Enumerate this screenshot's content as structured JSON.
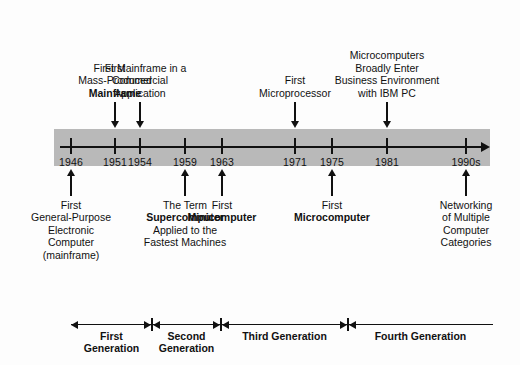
{
  "diagram": {
    "band_color": "#b9b9b9",
    "ink_color": "#111111"
  },
  "axis": {
    "start_year_label": "1946",
    "end_year_label": "1990s",
    "ticks": [
      {
        "label": "1946",
        "x": 71
      },
      {
        "label": "1951",
        "x": 115
      },
      {
        "label": "1954",
        "x": 140
      },
      {
        "label": "1959",
        "x": 185
      },
      {
        "label": "1963",
        "x": 222
      },
      {
        "label": "1971",
        "x": 295
      },
      {
        "label": "1975",
        "x": 332
      },
      {
        "label": "1981",
        "x": 387
      },
      {
        "label": "1990s",
        "x": 466
      }
    ]
  },
  "callouts_above": [
    {
      "id": "first-mass-produced-mainframe",
      "year": "1951",
      "x": 115,
      "lines": [
        {
          "text": "First",
          "bold": false
        },
        {
          "text": "Mass-Produced",
          "bold": false
        },
        {
          "text": "Mainframe",
          "bold": true
        }
      ]
    },
    {
      "id": "first-mainframe-commercial",
      "year": "1954",
      "x": 140,
      "lines": [
        {
          "text": "First Mainframe in a",
          "bold": false
        },
        {
          "text": "Commercial",
          "bold": false
        },
        {
          "text": "Application",
          "bold": false
        }
      ]
    },
    {
      "id": "first-microprocessor",
      "year": "1971",
      "x": 295,
      "lines": [
        {
          "text": "First",
          "bold": false
        },
        {
          "text": "Microprocessor",
          "bold": false
        }
      ]
    },
    {
      "id": "microcomputers-business",
      "year": "1981",
      "x": 387,
      "lines": [
        {
          "text": "Microcomputers",
          "bold": false
        },
        {
          "text": "Broadly Enter",
          "bold": false
        },
        {
          "text": "Business Environment",
          "bold": false
        },
        {
          "text": "with IBM PC",
          "bold": false
        }
      ]
    }
  ],
  "callouts_below": [
    {
      "id": "first-general-purpose-computer",
      "year": "1946",
      "x": 71,
      "lines": [
        {
          "text": "First",
          "bold": false
        },
        {
          "text": "General-Purpose",
          "bold": false
        },
        {
          "text": "Electronic",
          "bold": false
        },
        {
          "text": "Computer",
          "bold": false
        },
        {
          "text": "(mainframe)",
          "bold": false
        }
      ]
    },
    {
      "id": "term-supercomputer",
      "year": "1959",
      "x": 185,
      "lines": [
        {
          "text": "The Term",
          "bold": false
        },
        {
          "text": "Supercomputer",
          "bold": true
        },
        {
          "text": "Applied to the",
          "bold": false
        },
        {
          "text": "Fastest Machines",
          "bold": false
        }
      ]
    },
    {
      "id": "first-minicomputer",
      "year": "1963",
      "x": 222,
      "lines": [
        {
          "text": "First",
          "bold": false
        },
        {
          "text": "Minicomputer",
          "bold": true
        }
      ]
    },
    {
      "id": "first-microcomputer",
      "year": "1975",
      "x": 332,
      "lines": [
        {
          "text": "First",
          "bold": false
        },
        {
          "text": "Microcomputer",
          "bold": true
        }
      ]
    },
    {
      "id": "networking-multiple-categories",
      "year": "1990s",
      "x": 466,
      "lines": [
        {
          "text": "Networking",
          "bold": false
        },
        {
          "text": "of Multiple",
          "bold": false
        },
        {
          "text": "Computer",
          "bold": false
        },
        {
          "text": "Categories",
          "bold": false
        }
      ]
    }
  ],
  "generations": [
    {
      "id": "first-generation",
      "lines": [
        "First",
        "Generation"
      ],
      "start": 71,
      "end": 152
    },
    {
      "id": "second-generation",
      "lines": [
        "Second",
        "Generation"
      ],
      "start": 152,
      "end": 221
    },
    {
      "id": "third-generation",
      "lines": [
        "Third Generation"
      ],
      "start": 221,
      "end": 348
    },
    {
      "id": "fourth-generation",
      "lines": [
        "Fourth Generation"
      ],
      "start": 348,
      "end": 493
    }
  ],
  "chart_data": {
    "type": "timeline",
    "xlabel": "Year",
    "axis_range": [
      "1946",
      "1990s"
    ],
    "tick_labels": [
      "1946",
      "1951",
      "1954",
      "1959",
      "1963",
      "1971",
      "1975",
      "1981",
      "1990s"
    ],
    "events": [
      {
        "year": "1946",
        "label": "First General-Purpose Electronic Computer (mainframe)",
        "side": "below"
      },
      {
        "year": "1951",
        "label": "First Mass-Produced Mainframe",
        "side": "above"
      },
      {
        "year": "1954",
        "label": "First Mainframe in a Commercial Application",
        "side": "above"
      },
      {
        "year": "1959",
        "label": "The Term Supercomputer Applied to the Fastest Machines",
        "side": "below"
      },
      {
        "year": "1963",
        "label": "First Minicomputer",
        "side": "below"
      },
      {
        "year": "1971",
        "label": "First Microprocessor",
        "side": "above"
      },
      {
        "year": "1975",
        "label": "First Microcomputer",
        "side": "below"
      },
      {
        "year": "1981",
        "label": "Microcomputers Broadly Enter Business Environment with IBM PC",
        "side": "above"
      },
      {
        "year": "1990s",
        "label": "Networking of Multiple Computer Categories",
        "side": "below"
      }
    ],
    "eras": [
      {
        "name": "First Generation",
        "from": "1946",
        "to": "1958"
      },
      {
        "name": "Second Generation",
        "from": "1958",
        "to": "1963"
      },
      {
        "name": "Third Generation",
        "from": "1963",
        "to": "1975"
      },
      {
        "name": "Fourth Generation",
        "from": "1975",
        "to": "1990s"
      }
    ]
  }
}
